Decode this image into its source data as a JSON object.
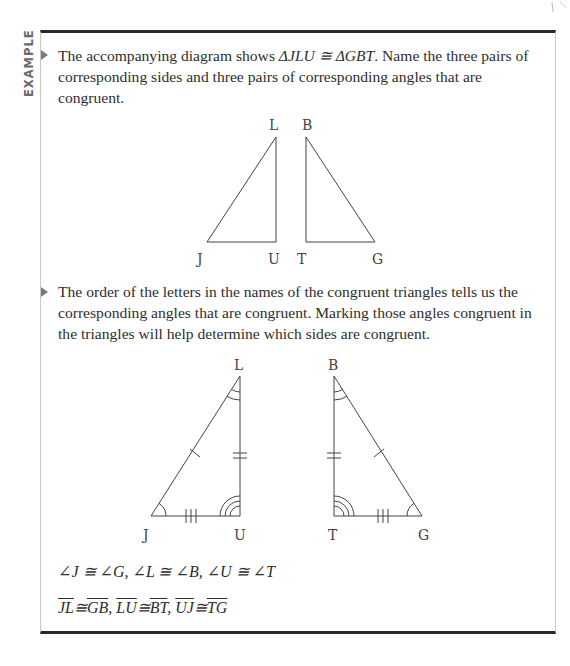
{
  "section_label": "EXAMPLE",
  "problem": {
    "text_before": "The accompanying diagram shows ",
    "statement": "ΔJLU ≅ ΔGBT",
    "text_after": ". Name the three pairs of corresponding sides and three pairs of corresponding angles that are congruent."
  },
  "diagram1": {
    "labels": {
      "L": "L",
      "B": "B",
      "J": "J",
      "U": "U",
      "T": "T",
      "G": "G"
    }
  },
  "solution": {
    "text": "The order of the letters in the names of the congruent triangles tells us the corresponding angles that are congruent. Marking those angles congruent in the triangles will help determine which sides are congruent."
  },
  "diagram2": {
    "labels": {
      "L": "L",
      "B": "B",
      "J": "J",
      "U": "U",
      "T": "T",
      "G": "G"
    }
  },
  "angles": {
    "line": "∠J ≅ ∠G, ∠L ≅ ∠B, ∠U ≅ ∠T"
  },
  "sides": {
    "pairs": [
      {
        "a": "JL",
        "b": "GB"
      },
      {
        "a": "LU",
        "b": "BT"
      },
      {
        "a": "UJ",
        "b": "TG"
      }
    ],
    "congruent_symbol": "≅",
    "separator": ", "
  }
}
